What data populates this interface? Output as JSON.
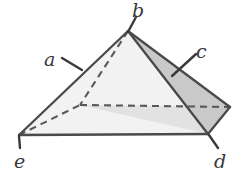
{
  "figure": {
    "kind": "geometry-diagram",
    "shape_name": "pyramid",
    "base_sides": 4,
    "width": 244,
    "height": 180,
    "background_color": "#ffffff"
  },
  "colors": {
    "face_front_left": "#f2f2f2",
    "face_front_right": "#e2e2e2",
    "face_side_sliver": "#c9c9c9",
    "outline": "#4a4a4c",
    "dashed_line": "#59595b",
    "label_text": "#38383a",
    "leader_line": "#3a3a3c"
  },
  "vertices": {
    "apex": {
      "name": "apex",
      "x": 128,
      "y": 31,
      "label": "b"
    },
    "left": {
      "name": "base-left",
      "x": 19,
      "y": 135,
      "label": "e"
    },
    "bottom": {
      "name": "base-bottom",
      "x": 208,
      "y": 134,
      "label": "d"
    },
    "right": {
      "name": "base-right",
      "x": 230,
      "y": 107,
      "label": ""
    },
    "hidden_back": {
      "name": "base-back-hidden",
      "x": 80,
      "y": 105,
      "label": ""
    }
  },
  "faces": [
    {
      "id": "front-left-face",
      "points": "128,31 19,135 208,134",
      "fill": "#f2f2f2"
    },
    {
      "id": "front-right-face",
      "points": "128,31 208,134 230,107",
      "fill": "#c9c9c9"
    },
    {
      "id": "base-right-wedge",
      "points": "208,134 230,107 80,105",
      "fill": "#e2e2e2"
    }
  ],
  "solid_edges": [
    {
      "id": "edge-apex-to-left",
      "x1": 128,
      "y1": 31,
      "x2": 19,
      "y2": 135
    },
    {
      "id": "edge-left-to-bottom",
      "x1": 19,
      "y1": 135,
      "x2": 208,
      "y2": 134
    },
    {
      "id": "edge-apex-to-bottom",
      "x1": 128,
      "y1": 31,
      "x2": 208,
      "y2": 134
    },
    {
      "id": "edge-apex-to-right",
      "x1": 128,
      "y1": 31,
      "x2": 230,
      "y2": 107
    },
    {
      "id": "edge-bottom-to-right",
      "x1": 208,
      "y1": 134,
      "x2": 230,
      "y2": 107
    }
  ],
  "dashed_edges": [
    {
      "id": "hidden-edge-apex-to-back",
      "x1": 128,
      "y1": 31,
      "x2": 80,
      "y2": 105
    },
    {
      "id": "hidden-edge-left-to-back",
      "x1": 19,
      "y1": 135,
      "x2": 80,
      "y2": 105
    },
    {
      "id": "hidden-edge-back-to-right",
      "x1": 80,
      "y1": 105,
      "x2": 230,
      "y2": 107
    }
  ],
  "labels": [
    {
      "id": "a",
      "text": "a",
      "refers_to": "left-slant-edge",
      "text_x": 44,
      "text_y": 50,
      "leader": {
        "x1": 62,
        "y1": 58,
        "x2": 82,
        "y2": 70
      }
    },
    {
      "id": "b",
      "text": "b",
      "refers_to": "apex-vertex",
      "text_x": 132,
      "text_y": 1,
      "leader": {
        "x1": 136,
        "y1": 17,
        "x2": 128,
        "y2": 32
      }
    },
    {
      "id": "c",
      "text": "c",
      "refers_to": "right-side-face",
      "text_x": 196,
      "text_y": 42,
      "leader": {
        "x1": 196,
        "y1": 54,
        "x2": 172,
        "y2": 76
      }
    },
    {
      "id": "d",
      "text": "d",
      "refers_to": "bottom-right-vertex",
      "text_x": 214,
      "text_y": 152,
      "leader": {
        "x1": 218,
        "y1": 148,
        "x2": 209,
        "y2": 135
      }
    },
    {
      "id": "e",
      "text": "e",
      "refers_to": "bottom-left-vertex",
      "text_x": 14,
      "text_y": 152,
      "leader": {
        "x1": 20,
        "y1": 148,
        "x2": 19,
        "y2": 136
      }
    }
  ]
}
